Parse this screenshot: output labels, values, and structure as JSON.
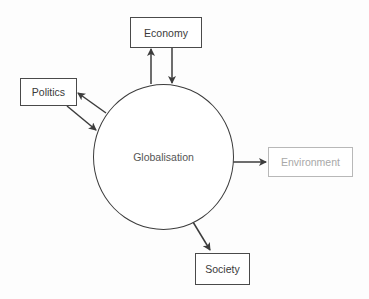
{
  "diagram": {
    "hub": {
      "label": "Globalisation"
    },
    "nodes": [
      {
        "id": "economy",
        "label": "Economy",
        "style": "normal"
      },
      {
        "id": "politics",
        "label": "Politics",
        "style": "normal"
      },
      {
        "id": "environment",
        "label": "Environment",
        "style": "faded"
      },
      {
        "id": "society",
        "label": "Society",
        "style": "normal"
      }
    ],
    "edges": [
      {
        "from": "Globalisation",
        "to": "Economy"
      },
      {
        "from": "Economy",
        "to": "Globalisation"
      },
      {
        "from": "Globalisation",
        "to": "Politics"
      },
      {
        "from": "Politics",
        "to": "Globalisation"
      },
      {
        "from": "Globalisation",
        "to": "Environment"
      },
      {
        "from": "Globalisation",
        "to": "Society"
      }
    ],
    "colors": {
      "line": "#3c3c3c",
      "faded": "#b0b0b0",
      "background": "#ffffff"
    }
  }
}
